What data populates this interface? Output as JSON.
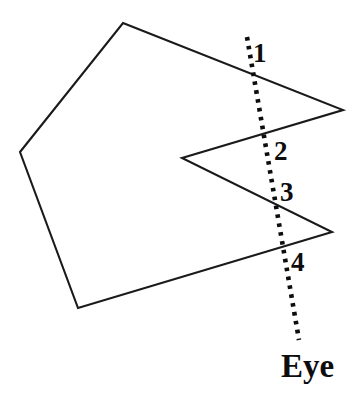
{
  "figure": {
    "background_color": "#ffffff",
    "stroke_color": "#1a1a1a",
    "width": 362,
    "height": 396
  },
  "polygon": {
    "name": "concave-polygon",
    "fill": "none",
    "stroke_width": 2.1,
    "vertices": [
      [
        123,
        23
      ],
      [
        343,
        110
      ],
      [
        182,
        158
      ],
      [
        332,
        232
      ],
      [
        78,
        308
      ],
      [
        20,
        152
      ]
    ],
    "points_attr": "123,23 343,110 182,158 332,232 78,308 20,152"
  },
  "ray": {
    "name": "eye-ray",
    "style": "dotted",
    "stroke_width": 4.6,
    "dash_pattern": "3.6 5.4",
    "start": [
      247,
      37
    ],
    "end": [
      299,
      340
    ],
    "path_d": "M 247 37 L 299 340"
  },
  "labels": {
    "intersections": [
      {
        "text": "1",
        "x": 253,
        "y": 62,
        "at_point": [
          250,
          66
        ]
      },
      {
        "text": "2",
        "x": 274,
        "y": 160,
        "at_point": [
          269,
          151
        ]
      },
      {
        "text": "3",
        "x": 280,
        "y": 201,
        "at_point": [
          277,
          192
        ]
      },
      {
        "text": "4",
        "x": 291,
        "y": 271,
        "at_point": [
          287,
          261
        ]
      }
    ],
    "eye": {
      "text": "Eye",
      "x": 281,
      "y": 377
    }
  }
}
